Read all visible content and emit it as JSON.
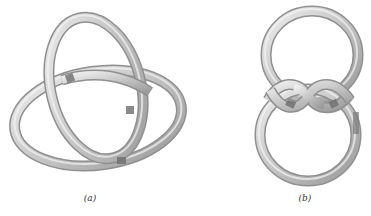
{
  "figure": {
    "panels": [
      {
        "label": "(a)",
        "subject": "trefoil-knot-tube-rendering"
      },
      {
        "label": "(b)",
        "subject": "twisted-double-loop-knot-tube-rendering"
      }
    ],
    "colors": {
      "tube_light": "#e6e6e6",
      "tube_mid": "#bdbdbd",
      "tube_dark": "#8a8a8a",
      "crossing_shadow": "#6e6e6e",
      "background": "#ffffff"
    }
  }
}
